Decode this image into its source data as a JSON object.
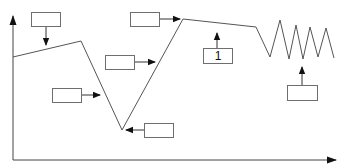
{
  "diagram": {
    "type": "annotated-line-graph",
    "colors": {
      "line": "#555555",
      "axis": "#444444",
      "arrow": "#111111",
      "box_border": "#6e6e6e"
    },
    "axes": {
      "y_axis": {
        "label": "",
        "has_arrow": true
      },
      "x_axis": {
        "label": "",
        "has_arrow": true
      }
    },
    "line_points": [
      [
        13,
        57
      ],
      [
        81,
        41
      ],
      [
        122,
        130
      ],
      [
        183,
        19
      ],
      [
        256,
        27
      ],
      [
        270,
        57
      ],
      [
        280,
        20
      ],
      [
        289,
        59
      ],
      [
        296,
        25
      ],
      [
        303,
        59
      ],
      [
        310,
        27
      ],
      [
        318,
        57
      ],
      [
        326,
        28
      ],
      [
        334,
        58
      ]
    ],
    "boxes": [
      {
        "id": "box-a",
        "text": "",
        "pointer": "down",
        "target": "first-segment"
      },
      {
        "id": "box-b",
        "text": "",
        "pointer": "right",
        "target": "peak"
      },
      {
        "id": "box-c",
        "text": "",
        "pointer": "right",
        "target": "rising-segment"
      },
      {
        "id": "box-d",
        "text": "1",
        "pointer": "up",
        "target": "plateau"
      },
      {
        "id": "box-e",
        "text": "",
        "pointer": "right",
        "target": "falling-segment"
      },
      {
        "id": "box-f",
        "text": "",
        "pointer": "left",
        "target": "trough"
      },
      {
        "id": "box-g",
        "text": "",
        "pointer": "up",
        "target": "oscillation"
      }
    ]
  }
}
